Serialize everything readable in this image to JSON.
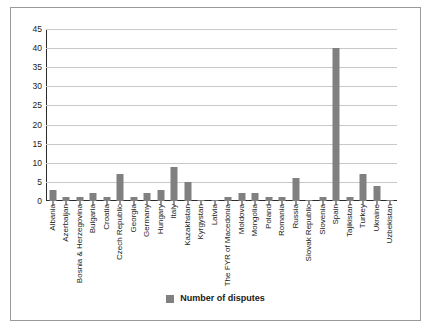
{
  "chart_data": {
    "type": "bar",
    "title": "",
    "subtitle": "",
    "xlabel": "",
    "ylabel": "",
    "ylim": [
      0,
      45
    ],
    "ytick_step": 5,
    "yticks": [
      0,
      5,
      10,
      15,
      20,
      25,
      30,
      35,
      40,
      45
    ],
    "grid": true,
    "legend_position": "bottom",
    "bar_color": "#808080",
    "categories": [
      "Albania",
      "Azerbaijan",
      "Bosnia & Herzegovina",
      "Bulgaria",
      "Croatia",
      "Czech Republic",
      "Georgia",
      "Germany",
      "Hungary",
      "Italy",
      "Kazakhstan",
      "Kyrgystan",
      "Latvia",
      "The FYR of Macedonia",
      "Moldova",
      "Mongolia",
      "Poland",
      "Romania",
      "Russia",
      "Slovak Republic",
      "Slovenia",
      "Spain",
      "Tajikistan",
      "Turkey",
      "Ukraine",
      "Uzbekistan"
    ],
    "series": [
      {
        "name": "Number of disputes",
        "values": [
          3,
          1,
          1,
          2,
          1,
          7,
          1,
          2,
          3,
          9,
          5,
          0,
          0,
          1,
          2,
          2,
          1,
          1,
          6,
          0,
          1,
          40,
          1,
          7,
          4,
          0
        ]
      }
    ]
  },
  "legend": {
    "entries": [
      {
        "label": "Number of disputes",
        "color": "#808080"
      }
    ]
  },
  "axis": {
    "ytick_labels": [
      "0",
      "5",
      "10",
      "15",
      "20",
      "25",
      "30",
      "35",
      "40",
      "45"
    ]
  }
}
